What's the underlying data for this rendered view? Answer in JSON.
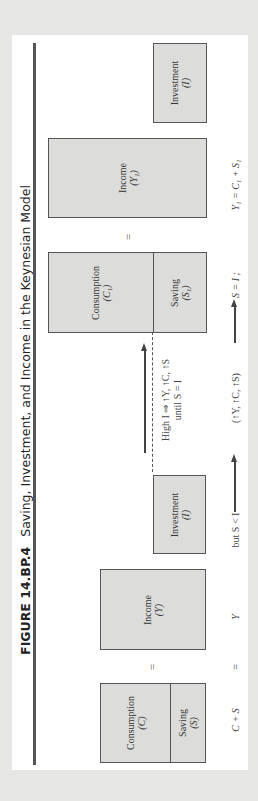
{
  "figure": {
    "label": "FIGURE 14.BP.4",
    "title": "Saving, Investment, and Income in the Keynesian Model",
    "orientation": "rotated 90° counter-clockwise",
    "colors": {
      "page_background": "#e6e6e4",
      "panel_background": "#ffffff",
      "box_fill": "#dcdcda",
      "box_border": "#555555",
      "text": "#333333"
    }
  },
  "initial_state": {
    "consumption": {
      "label": "Consumption",
      "symbol": "(C)"
    },
    "saving": {
      "label": "Saving",
      "symbol": "(S)"
    },
    "equals": "=",
    "income": {
      "label": "Income",
      "symbol": "(Y)"
    },
    "investment": {
      "label": "Investment",
      "symbol": "(I)"
    }
  },
  "transition": {
    "text_line1": "High I ⇒ ↑Y, ↑C, ↑S",
    "text_line2": "until S = I",
    "arrow": "up-arrow"
  },
  "final_state": {
    "consumption": {
      "label": "Consumption",
      "symbol": "(C₁)"
    },
    "saving": {
      "label": "Saving",
      "symbol": "(S₁)"
    },
    "equals": "=",
    "income": {
      "label": "Income",
      "symbol": "(Y₁)"
    },
    "investment": {
      "label": "Investment",
      "symbol": "(I)"
    }
  },
  "equations": {
    "c_plus_s": "C + S",
    "equals": "=",
    "y": "Y",
    "but": "but S < I",
    "changes": "(↑Y, ↑C, ↑S)",
    "s_equals_i": "S = I ;",
    "final": "Y₁ = C₁ + S₁"
  }
}
